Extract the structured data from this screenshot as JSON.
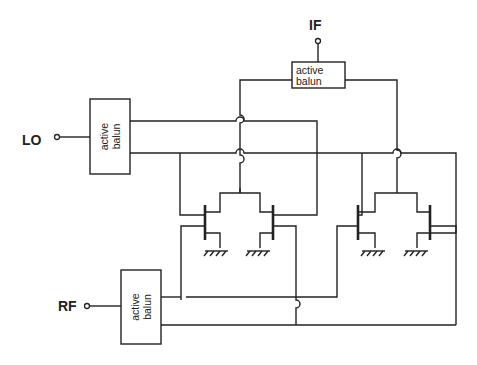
{
  "diagram": {
    "type": "circuit-schematic",
    "ports": {
      "if": "IF",
      "lo": "LO",
      "rf": "RF"
    },
    "baluns": {
      "if": {
        "line1": "active",
        "line2": "balun"
      },
      "lo": {
        "line1": "active",
        "line2": "balun"
      },
      "rf": {
        "line1": "active",
        "line2": "balun"
      }
    },
    "colors": {
      "line": "#222222",
      "background": "#ffffff"
    }
  }
}
